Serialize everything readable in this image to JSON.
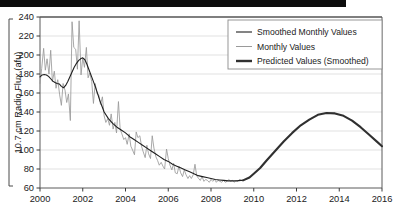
{
  "figure": {
    "top_band_color": "#0d0d0d",
    "background_color": "#ffffff",
    "frame_color": "#5a5a5a",
    "grid_color": "#d9d9d9"
  },
  "chart_data": {
    "type": "line",
    "title": "",
    "xlabel": "",
    "ylabel": "10.7 cm Radio Flux (afu)",
    "xlim": [
      2000,
      2016
    ],
    "ylim": [
      60,
      240
    ],
    "xticks": [
      2000,
      2002,
      2004,
      2006,
      2008,
      2010,
      2012,
      2014,
      2016
    ],
    "yticks": [
      60,
      80,
      100,
      120,
      140,
      160,
      180,
      200,
      220,
      240
    ],
    "grid": "horizontal",
    "legend_position": "top-right",
    "series": [
      {
        "name": "Smoothed Monthly Values",
        "color": "#1f1f1f",
        "width": 1.1,
        "x": [
          2000.0,
          2000.1,
          2000.2,
          2000.3,
          2000.4,
          2000.5,
          2000.6,
          2000.7,
          2000.8,
          2000.9,
          2001.0,
          2001.1,
          2001.2,
          2001.3,
          2001.4,
          2001.5,
          2001.6,
          2001.7,
          2001.8,
          2001.9,
          2002.0,
          2002.1,
          2002.2,
          2002.3,
          2002.4,
          2002.5,
          2002.6,
          2002.7,
          2002.8,
          2002.9,
          2003.0,
          2003.2,
          2003.4,
          2003.6,
          2003.8,
          2004.0,
          2004.2,
          2004.4,
          2004.6,
          2004.8,
          2005.0,
          2005.2,
          2005.4,
          2005.6,
          2005.8,
          2006.0,
          2006.2,
          2006.4,
          2006.6,
          2006.8,
          2007.0,
          2007.2,
          2007.4,
          2007.6,
          2007.8,
          2008.0,
          2008.2,
          2008.4,
          2008.6,
          2008.8,
          2009.0,
          2009.2,
          2009.4,
          2009.5
        ],
        "y": [
          177,
          179,
          179.5,
          179,
          177.5,
          175,
          172.5,
          171,
          170,
          169.5,
          167,
          165.5,
          168,
          172,
          177,
          182,
          187,
          191,
          194,
          196,
          197,
          195,
          190,
          184,
          178,
          172,
          166,
          159,
          152,
          146,
          140,
          133,
          128,
          124,
          121,
          118,
          114,
          111,
          108,
          105,
          102,
          99,
          96,
          93,
          90,
          88,
          85,
          83,
          81,
          79,
          77,
          75,
          73,
          72,
          71,
          70,
          69,
          68.5,
          68,
          67.5,
          67.5,
          67.5,
          68,
          68
        ]
      },
      {
        "name": "Monthly Values",
        "color": "#9a9a9a",
        "width": 0.85,
        "x": [
          2000.0,
          2000.08,
          2000.17,
          2000.25,
          2000.33,
          2000.42,
          2000.5,
          2000.58,
          2000.67,
          2000.75,
          2000.83,
          2000.92,
          2001.0,
          2001.08,
          2001.17,
          2001.25,
          2001.33,
          2001.42,
          2001.5,
          2001.58,
          2001.67,
          2001.75,
          2001.83,
          2001.92,
          2002.0,
          2002.08,
          2002.17,
          2002.25,
          2002.33,
          2002.42,
          2002.5,
          2002.58,
          2002.67,
          2002.75,
          2002.83,
          2002.92,
          2003.0,
          2003.08,
          2003.17,
          2003.25,
          2003.33,
          2003.42,
          2003.5,
          2003.58,
          2003.67,
          2003.75,
          2003.83,
          2003.92,
          2004.0,
          2004.08,
          2004.17,
          2004.25,
          2004.33,
          2004.42,
          2004.5,
          2004.58,
          2004.67,
          2004.75,
          2004.83,
          2004.92,
          2005.0,
          2005.08,
          2005.17,
          2005.25,
          2005.33,
          2005.42,
          2005.5,
          2005.58,
          2005.67,
          2005.75,
          2005.83,
          2005.92,
          2006.0,
          2006.08,
          2006.17,
          2006.25,
          2006.33,
          2006.42,
          2006.5,
          2006.58,
          2006.67,
          2006.75,
          2006.83,
          2006.92,
          2007.0,
          2007.08,
          2007.17,
          2007.25,
          2007.33,
          2007.42,
          2007.5,
          2007.58,
          2007.67,
          2007.75,
          2007.83,
          2007.92,
          2008.0,
          2008.08,
          2008.17,
          2008.25,
          2008.33,
          2008.42,
          2008.5,
          2008.58,
          2008.67,
          2008.75,
          2008.83,
          2008.92,
          2009.0,
          2009.08,
          2009.17,
          2009.25,
          2009.33,
          2009.42,
          2009.5
        ],
        "y": [
          170,
          186,
          207,
          184,
          196,
          180,
          205,
          172,
          183,
          165,
          174,
          158,
          147,
          170,
          163,
          150,
          159,
          131,
          235,
          208,
          206,
          185,
          236,
          179,
          197,
          187,
          208,
          176,
          181,
          172,
          149,
          170,
          159,
          158,
          148,
          156,
          136,
          129,
          133,
          126,
          138,
          122,
          129,
          118,
          151,
          122,
          117,
          111,
          113,
          106,
          117,
          104,
          100,
          95,
          119,
          113,
          115,
          104,
          98,
          92,
          105,
          96,
          91,
          115,
          102,
          93,
          89,
          84,
          87,
          83,
          80,
          101,
          91,
          84,
          79,
          86,
          76,
          75,
          83,
          76,
          72,
          79,
          74,
          70,
          73,
          70,
          74,
          85,
          73,
          70,
          68,
          72,
          67,
          69,
          68,
          66,
          69,
          67,
          69,
          66,
          68,
          67,
          66,
          68,
          66,
          67,
          69,
          67,
          68,
          66,
          68,
          67,
          69,
          68,
          68
        ]
      },
      {
        "name": "Predicted Values (Smoothed)",
        "color": "#303030",
        "width": 2.1,
        "x": [
          2009.5,
          2009.8,
          2010.0,
          2010.3,
          2010.6,
          2011.0,
          2011.4,
          2011.8,
          2012.2,
          2012.6,
          2013.0,
          2013.4,
          2013.8,
          2014.2,
          2014.6,
          2015.0,
          2015.4,
          2015.8,
          2016.0
        ],
        "y": [
          68,
          71,
          75,
          81,
          89,
          99,
          109,
          118,
          126,
          132,
          137,
          139,
          138.5,
          136,
          131,
          124,
          116,
          108,
          104
        ]
      }
    ]
  },
  "legend": {
    "items": [
      {
        "label": "Smoothed Monthly Values",
        "color": "#1f1f1f",
        "width": 1.1
      },
      {
        "label": "Monthly Values",
        "color": "#9a9a9a",
        "width": 1.0
      },
      {
        "label": "Predicted Values (Smoothed)",
        "color": "#303030",
        "width": 2.4
      }
    ]
  },
  "axes": {
    "y_axis_label": "10.7 cm Radio Flux (afu)",
    "x_tick_labels": [
      "2000",
      "2002",
      "2004",
      "2006",
      "2008",
      "2010",
      "2012",
      "2014",
      "2016"
    ],
    "y_tick_labels": [
      "240",
      "220",
      "200",
      "180",
      "160",
      "140",
      "120",
      "100",
      "80",
      "60"
    ]
  }
}
